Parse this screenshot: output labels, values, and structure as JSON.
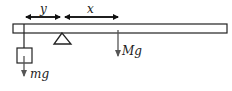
{
  "diagram": {
    "type": "lever-balance",
    "labels": {
      "y_distance": "y",
      "x_distance": "x",
      "beam_weight": "Mg",
      "hanging_weight": "mg"
    },
    "colors": {
      "stroke": "#222222",
      "arrow": "#555555",
      "background": "#ffffff"
    }
  }
}
